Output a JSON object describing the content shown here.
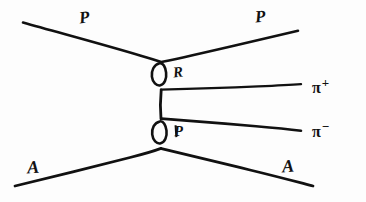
{
  "figure": {
    "kind": "hand-drawn-particle-physics-diagram",
    "background_color": "#fdfdfd",
    "ink_color": "#111111",
    "width": 366,
    "height": 202
  },
  "labels": {
    "proton_incoming": "P",
    "proton_outgoing": "P",
    "nucleus_incoming": "A",
    "nucleus_outgoing": "A",
    "reggeon": "R",
    "pomeron": "P",
    "pion_plus_symbol": "π",
    "pion_plus_sign": "+",
    "pion_minus_symbol": "π",
    "pion_minus_sign": "−"
  },
  "vertices": {
    "upper_blob_name": "0",
    "lower_blob_name": "0",
    "upper_vertex": {
      "x": 162,
      "y": 62
    },
    "lower_vertex": {
      "x": 161,
      "y": 148
    }
  },
  "lines": {
    "proton_in": {
      "x1": 23,
      "y1": 23,
      "x2": 162,
      "y2": 62
    },
    "proton_out": {
      "x1": 162,
      "y1": 62,
      "x2": 298,
      "y2": 31
    },
    "nucleus_in": {
      "x1": 15,
      "y1": 186,
      "x2": 161,
      "y2": 148
    },
    "nucleus_out": {
      "x1": 161,
      "y1": 148,
      "x2": 313,
      "y2": 186
    },
    "exchange_vertical": {
      "x1": 161,
      "y1": 90,
      "x2": 161,
      "y2": 119
    },
    "pion_plus": {
      "x1": 161,
      "y1": 90,
      "x2": 301,
      "y2": 84
    },
    "pion_minus": {
      "x1": 161,
      "y1": 119,
      "x2": 301,
      "y2": 131
    }
  }
}
